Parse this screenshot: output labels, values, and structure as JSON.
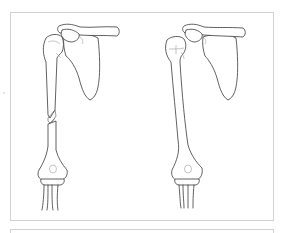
{
  "figure": {
    "panels": [
      {
        "id": "left",
        "subject": "shoulder-humerus-fractured",
        "fracture": "mid-shaft humerus fracture"
      },
      {
        "id": "right",
        "subject": "shoulder-humerus-intact",
        "fracture": "none"
      }
    ],
    "colors": {
      "line": "#3a3a3a",
      "frame_border": "#d2d2d2",
      "background": "#ffffff"
    }
  }
}
